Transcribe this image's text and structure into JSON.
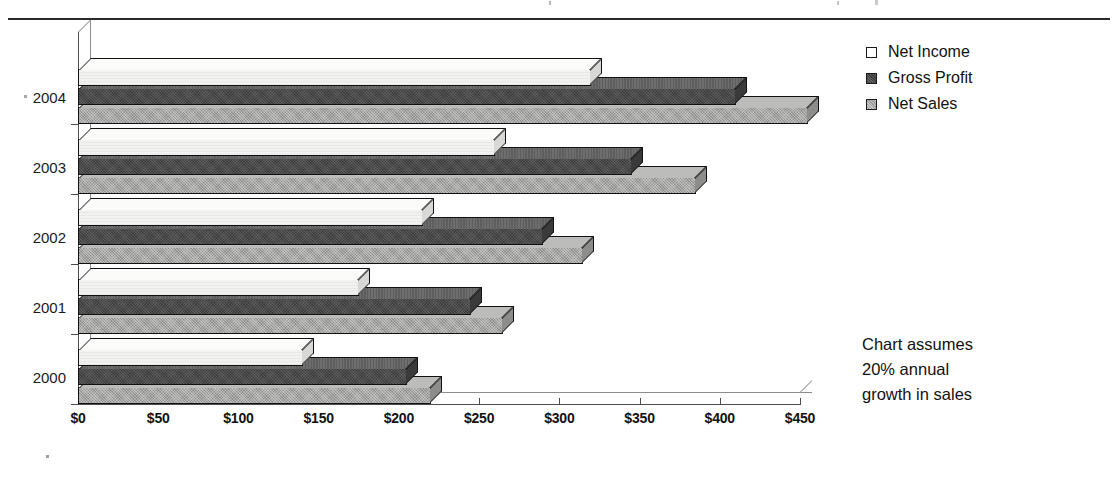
{
  "chart_data": {
    "type": "bar",
    "orientation": "horizontal",
    "style": "3d-grouped-horizontal",
    "title": "",
    "xlabel": "",
    "ylabel": "",
    "categories": [
      "2000",
      "2001",
      "2002",
      "2003",
      "2004"
    ],
    "category_order_top_to_bottom": [
      "2004",
      "2003",
      "2002",
      "2001",
      "2000"
    ],
    "series": [
      {
        "name": "Net Income",
        "values": [
          140,
          175,
          215,
          260,
          320
        ],
        "color": "#f2f2f0"
      },
      {
        "name": "Gross Profit",
        "values": [
          205,
          245,
          290,
          345,
          410
        ],
        "color": "#4a4a4a"
      },
      {
        "name": "Net Sales",
        "values": [
          220,
          265,
          315,
          385,
          455
        ],
        "color": "#a6a6a4"
      }
    ],
    "xlim": [
      0,
      450
    ],
    "xticks": [
      0,
      50,
      100,
      150,
      200,
      250,
      300,
      350,
      400,
      450
    ],
    "xtick_labels": [
      "$0",
      "$50",
      "$100",
      "$150",
      "$200",
      "$250",
      "$300",
      "$350",
      "$400",
      "$450"
    ],
    "grid": false,
    "legend_position": "right-top",
    "legend_entries": [
      "Net Income",
      "Gross Profit",
      "Net Sales"
    ],
    "annotations": [
      "Chart assumes",
      "20% annual",
      "growth in sales"
    ]
  },
  "legend": {
    "items": [
      {
        "label": "Net Income",
        "swatch": "netincome"
      },
      {
        "label": "Gross Profit",
        "swatch": "grossprofit"
      },
      {
        "label": "Net Sales",
        "swatch": "netsales"
      }
    ]
  },
  "annotation": {
    "line1": "Chart assumes",
    "line2": "20% annual",
    "line3": "growth in sales"
  }
}
